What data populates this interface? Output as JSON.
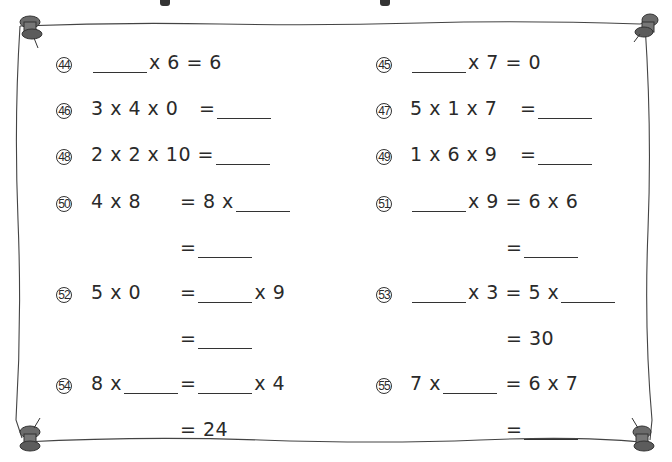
{
  "worksheet": {
    "problems": [
      {
        "id": "44",
        "number_label": "44",
        "parts": {
          "a": "",
          "b": "x 6 = 6"
        }
      },
      {
        "id": "45",
        "number_label": "45",
        "parts": {
          "a": "",
          "b": "x 7",
          "c": "= 0"
        }
      },
      {
        "id": "46",
        "number_label": "46",
        "parts": {
          "a": "3 x 4 x 0",
          "b": "="
        }
      },
      {
        "id": "47",
        "number_label": "47",
        "parts": {
          "a": "5 x 1 x 7",
          "b": "="
        }
      },
      {
        "id": "48",
        "number_label": "48",
        "parts": {
          "a": "2 x 2 x 10 =",
          "b": ""
        }
      },
      {
        "id": "49",
        "number_label": "49",
        "parts": {
          "a": "1 x 6 x 9",
          "b": "="
        }
      },
      {
        "id": "50",
        "number_label": "50",
        "parts": {
          "a": "4 x 8",
          "b": "= 8 x",
          "c": "="
        }
      },
      {
        "id": "51",
        "number_label": "51",
        "parts": {
          "a": "x 9",
          "b": "= 6 x 6",
          "c": "="
        }
      },
      {
        "id": "52",
        "number_label": "52",
        "parts": {
          "a": "5 x 0",
          "b": "=",
          "c": "x 9",
          "d": "="
        }
      },
      {
        "id": "53",
        "number_label": "53",
        "parts": {
          "a": "x 3",
          "b": "= 5 x",
          "c": "= 30"
        }
      },
      {
        "id": "54",
        "number_label": "54",
        "parts": {
          "a": "8 x",
          "b": "=",
          "c": "x 4",
          "d": "= 24"
        }
      },
      {
        "id": "55",
        "number_label": "55",
        "parts": {
          "a": "7 x",
          "b": "= 6 x 7",
          "c": "="
        }
      }
    ]
  },
  "colors": {
    "frame": "#555555",
    "pin": "#6b6b6b",
    "text": "#2a2a2a"
  }
}
